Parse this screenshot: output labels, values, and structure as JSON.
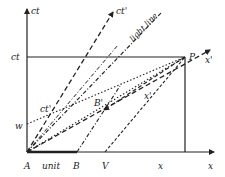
{
  "diagram": {
    "type": "spacetime-diagram",
    "axes": {
      "vertical_label": "ct",
      "horizontal_label": "x"
    },
    "lines": {
      "ct_prime_label": "ct'",
      "light_line_label": "light line",
      "x_prime_label": "x'"
    },
    "points": {
      "P": "P",
      "ct_level": "ct",
      "w": "w",
      "ct_prime_point": "ct'",
      "B_prime": "B'",
      "x_prime_point": "x'",
      "A": "A",
      "unit": "unit",
      "B": "B",
      "V": "V",
      "x_point": "x"
    },
    "colors": {
      "ink": "#222222",
      "background": "#ffffff"
    }
  }
}
